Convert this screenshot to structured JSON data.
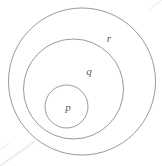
{
  "diagram": {
    "type": "euler-nested-circles",
    "background_color": "#ffffff",
    "stroke_color": "#8d8d92",
    "label_color": "#59595e",
    "artifact_color": "#d8d8dc",
    "canvas": {
      "width": 162,
      "height": 166
    },
    "sets": [
      {
        "id": "r",
        "label": "r",
        "role": "outer-set",
        "cx": 82,
        "cy": 81.5,
        "r": 73.5,
        "stroke_width": 0.9,
        "label_x": 109,
        "label_y": 39,
        "label_font_size": 11
      },
      {
        "id": "q",
        "label": "q",
        "role": "middle-set",
        "cx": 73.5,
        "cy": 89,
        "r": 50,
        "stroke_width": 0.9,
        "label_x": 89,
        "label_y": 72,
        "label_font_size": 11
      },
      {
        "id": "p",
        "label": "p",
        "role": "inner-set",
        "cx": 66.5,
        "cy": 106.5,
        "r": 21.5,
        "stroke_width": 0.9,
        "label_x": 68,
        "label_y": 108,
        "label_font_size": 11
      }
    ],
    "artifacts": [
      {
        "id": "bottom-left-streak",
        "x1": 0,
        "y1": 166,
        "x2": 34,
        "y2": 142,
        "stroke_width": 1.6,
        "opacity": 0.5
      },
      {
        "id": "top-right-streak",
        "x1": 162,
        "y1": 0,
        "x2": 150,
        "y2": 9,
        "stroke_width": 1.4,
        "opacity": 0.35
      },
      {
        "id": "left-edge-streak",
        "x1": 0,
        "y1": 150,
        "x2": 10,
        "y2": 143,
        "stroke_width": 1.2,
        "opacity": 0.3
      }
    ]
  }
}
